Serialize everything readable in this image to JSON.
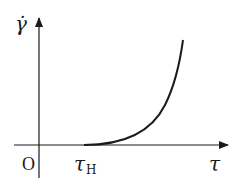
{
  "diagram": {
    "type": "line-plot-sketch",
    "y_axis_label": "γ̇",
    "x_axis_label": "τ",
    "origin_label": "O",
    "threshold_label": "τ",
    "threshold_subscript": "H",
    "curve_description": "Zero until τ_H, then rises steeply (convex, exponential-like)",
    "line_color": "#1a1a1a"
  }
}
